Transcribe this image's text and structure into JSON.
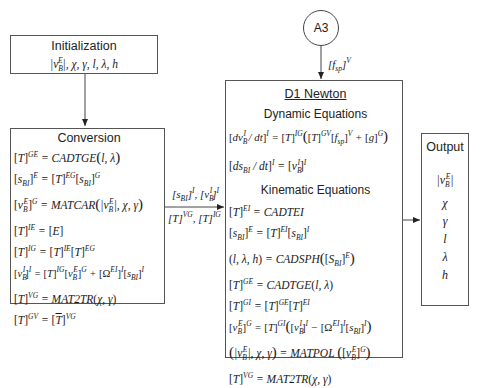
{
  "diagram": {
    "initialization": {
      "title": "Initialization",
      "vars": ", χ, γ, l, λ, h"
    },
    "connector": {
      "label": "A3",
      "input_label": "[f_sp]^V"
    },
    "conversion": {
      "title": "Conversion",
      "equations": [
        "[T]^GE = CADTGE(l, λ)",
        "[s_BI]^E = [T]^EG [s_BI]^G",
        "[v_B^E]^G = MATCAR(|v_B^E|, χ, γ)",
        "[T]^IE = [E]",
        "[T]^IG = [T]^IE [T]^EG",
        "[v_B^I]^I = [T]^IG [v_B^E]^G + [Ω^EI]^I [s_BI]^I",
        "[T]^VG = MAT2TR(χ, γ)",
        "[T]^GV = [T̄]^VG"
      ]
    },
    "link": {
      "top": "[s_BI]^I, [v_B^I]^I",
      "bottom": "[T]^VG, [T]^IG"
    },
    "newton": {
      "title": "D1 Newton",
      "dynamic_heading": "Dynamic Equations",
      "dynamic_equations": [
        "[dv_B^I / dt]^I = [T]^IG ( [T]^GV [f_sp]^V + [g]^G )",
        "[ds_BI / dt]^I = [v_B^I]^I"
      ],
      "kinematic_heading": "Kinematic Equations",
      "kinematic_equations": [
        "[T]^EI = CADTEI",
        "[s_BI]^E = [T]^EI [s_BI]^I",
        "(l, λ, h) = CADSPH([S_BI]^E)",
        "[T]^GE = CADTGE(l, λ)",
        "[T]^GI = [T]^GE [T]^EI",
        "[v_B^E]^G = [T]^GI ( [v_B^I]^I − [Ω^EI]^I [s_BI]^I )",
        "(|v_B^E|, χ, γ) = MATPOL([v_B^E]^G)",
        "[T]^VG = MAT2TR(χ, γ)"
      ]
    },
    "output": {
      "title": "Output",
      "items": [
        "|v_B^E|",
        "χ",
        "γ",
        "l",
        "λ",
        "h"
      ],
      "symbols": {
        "chi": "χ",
        "gamma": "γ",
        "l": "l",
        "lambda": "λ",
        "h": "h"
      }
    },
    "colors": {
      "line": "#444444",
      "text": "#1a1a1a"
    }
  }
}
